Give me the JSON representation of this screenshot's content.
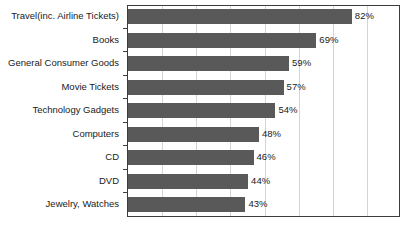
{
  "chart_data": {
    "type": "bar",
    "orientation": "horizontal",
    "title": "",
    "xlabel": "",
    "ylabel": "",
    "xlim": [
      0,
      100
    ],
    "grid": true,
    "legend": false,
    "value_suffix": "%",
    "categories": [
      "Travel(inc. Airline Tickets)",
      "Books",
      "General Consumer Goods",
      "Movie Tickets",
      "Technology Gadgets",
      "Computers",
      "CD",
      "DVD",
      "Jewelry, Watches"
    ],
    "values": [
      82,
      69,
      59,
      57,
      54,
      48,
      46,
      44,
      43
    ],
    "data_labels": [
      "82%",
      "69%",
      "59%",
      "57%",
      "54%",
      "48%",
      "46%",
      "44%",
      "43%"
    ],
    "bar_color": "#595959",
    "grid_color": "#d4d4d4",
    "frame_color": "#3d3d3d",
    "text_color": "#1a1a1a",
    "gridline_values": [
      12.5,
      25,
      37.5,
      50,
      62.5,
      75,
      87.5
    ]
  }
}
